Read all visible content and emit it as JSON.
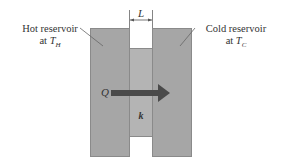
{
  "diagram": {
    "type": "heat-conduction-slab",
    "hot_reservoir": {
      "line1": "Hot reservoir",
      "line2_prefix": "at ",
      "symbol": "T",
      "subscript": "H"
    },
    "cold_reservoir": {
      "line1": "Cold reservoir",
      "line2_prefix": "at ",
      "symbol": "T",
      "subscript": "C"
    },
    "slab_thickness_label": "L",
    "heat_flow_label": "Q",
    "conductivity_label": "k",
    "colors": {
      "reservoir_fill": "#a6a6a6",
      "slab_fill": "#b4b4b4",
      "arrow": "#4a4a4a",
      "text": "#333333"
    }
  }
}
